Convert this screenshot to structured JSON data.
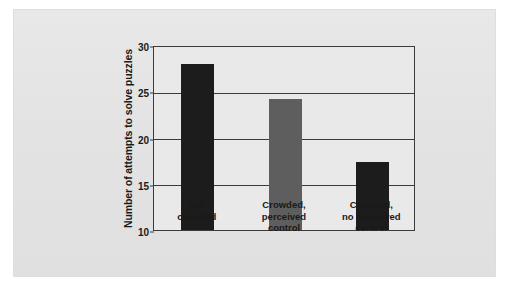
{
  "chart_data": {
    "type": "bar",
    "title": "",
    "subtitle": "",
    "xlabel": "",
    "ylabel": "Number of attempts to solve puzzles",
    "categories": [
      "Not\ncrowded",
      "Crowded,\nperceived\ncontrol",
      "Crowded,\nno perceived\ncontrol"
    ],
    "category_labels_flat": [
      "Not crowded",
      "Crowded, perceived control",
      "Crowded, no perceived control"
    ],
    "values": [
      28,
      24.2,
      17.3
    ],
    "ylim": [
      10,
      30
    ],
    "yticks": [
      10,
      15,
      20,
      25,
      30
    ],
    "ytick_labels": [
      "10",
      "15",
      "20",
      "25",
      "30"
    ],
    "grid": true,
    "legend": "none",
    "bar_colors": [
      "#1c1c1c",
      "#5e5e5e",
      "#1c1c1c"
    ],
    "panel_color": "#e4e4e4",
    "plot_background": "#e9e9e9",
    "axis_color": "#3b3b3b"
  },
  "figure": {
    "panel_label": "chart-panel"
  }
}
